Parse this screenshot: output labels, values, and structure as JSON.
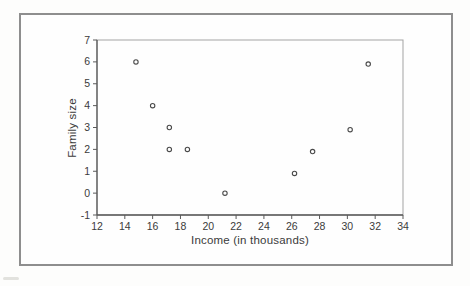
{
  "figure": {
    "background_color": "#fdfdfc",
    "frame_color": "#8e8e8e"
  },
  "chart_data": {
    "type": "scatter",
    "title": "",
    "xlabel": "Income (in thousands)",
    "ylabel": "Family size",
    "xlim": [
      12,
      34
    ],
    "ylim": [
      -1,
      7
    ],
    "x_ticks": [
      12,
      14,
      16,
      18,
      20,
      22,
      24,
      26,
      28,
      30,
      32,
      34
    ],
    "y_ticks": [
      7,
      6,
      5,
      4,
      3,
      2,
      1,
      0,
      -1
    ],
    "grid": false,
    "legend": null,
    "marker": "open-circle",
    "marker_color": "#4a4a4a",
    "axis_color": "#5a5a5a",
    "box_color": "#a3a3a3",
    "text_color": "#3b3b3b",
    "points": [
      {
        "x": 14.8,
        "y": 6.0
      },
      {
        "x": 16.0,
        "y": 4.0
      },
      {
        "x": 17.2,
        "y": 3.0
      },
      {
        "x": 17.2,
        "y": 2.0
      },
      {
        "x": 18.5,
        "y": 2.0
      },
      {
        "x": 21.2,
        "y": 0.0
      },
      {
        "x": 26.2,
        "y": 0.9
      },
      {
        "x": 27.5,
        "y": 1.9
      },
      {
        "x": 30.2,
        "y": 2.9
      },
      {
        "x": 31.5,
        "y": 5.9
      }
    ]
  }
}
